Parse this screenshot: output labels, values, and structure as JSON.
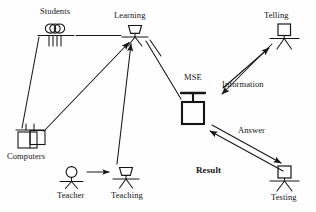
{
  "diagram": {
    "background_color": "#fefefe",
    "stroke_color": "#161616",
    "nodes": [
      {
        "id": "students",
        "label": "Students",
        "icon": "multiple-stick-figures-icon",
        "label_x": 40,
        "label_y": 6
      },
      {
        "id": "learning",
        "label": "Learning",
        "icon": "trapezoid-head-actor-icon",
        "label_x": 114,
        "label_y": 10
      },
      {
        "id": "telling",
        "label": "Telling",
        "icon": "square-head-actor-icon",
        "label_x": 264,
        "label_y": 10
      },
      {
        "id": "mse",
        "label": "MSE",
        "icon": "mse-block-icon",
        "label_x": 184,
        "label_y": 70
      },
      {
        "id": "computers",
        "label": "Computers",
        "icon": "computers-icon",
        "label_x": 7,
        "label_y": 152
      },
      {
        "id": "teacher",
        "label": "Teacher",
        "icon": "round-head-actor-icon",
        "label_x": 58,
        "label_y": 190
      },
      {
        "id": "teaching",
        "label": "Teaching",
        "icon": "trapezoid-head-actor-icon",
        "label_x": 112,
        "label_y": 190
      },
      {
        "id": "testing",
        "label": "Testing",
        "icon": "square-head-actor-icon",
        "label_x": 272,
        "label_y": 190
      }
    ],
    "edge_labels": [
      {
        "id": "information",
        "label": "Information",
        "x": 222,
        "y": 78,
        "bold": false
      },
      {
        "id": "answer",
        "label": "Answer",
        "x": 238,
        "y": 125,
        "bold": false
      },
      {
        "id": "result",
        "label": "Result",
        "x": 196,
        "y": 166,
        "bold": true
      }
    ],
    "edges": [
      {
        "id": "students-learning",
        "from": "students",
        "to": "learning",
        "style": "plain-line"
      },
      {
        "id": "students-computers",
        "from": "students",
        "to": "computers",
        "style": "plain-line"
      },
      {
        "id": "computers-learning",
        "from": "computers",
        "to": "learning",
        "style": "arrow"
      },
      {
        "id": "teacher-teaching",
        "from": "teacher",
        "to": "teaching",
        "style": "arrow"
      },
      {
        "id": "teaching-learning",
        "from": "teaching",
        "to": "learning",
        "style": "arrow"
      },
      {
        "id": "learning-mse",
        "from": "learning",
        "to": "mse",
        "style": "plain-line"
      },
      {
        "id": "mse-telling",
        "from": "mse",
        "to": "telling",
        "style": "arrow-up",
        "label": "Information"
      },
      {
        "id": "telling-mse",
        "from": "telling",
        "to": "mse",
        "style": "arrow-down",
        "label": "Information"
      },
      {
        "id": "mse-testing",
        "from": "mse",
        "to": "testing",
        "style": "arrow",
        "label": "Answer"
      },
      {
        "id": "testing-mse",
        "from": "testing",
        "to": "mse",
        "style": "arrow",
        "label": "Result"
      }
    ]
  }
}
